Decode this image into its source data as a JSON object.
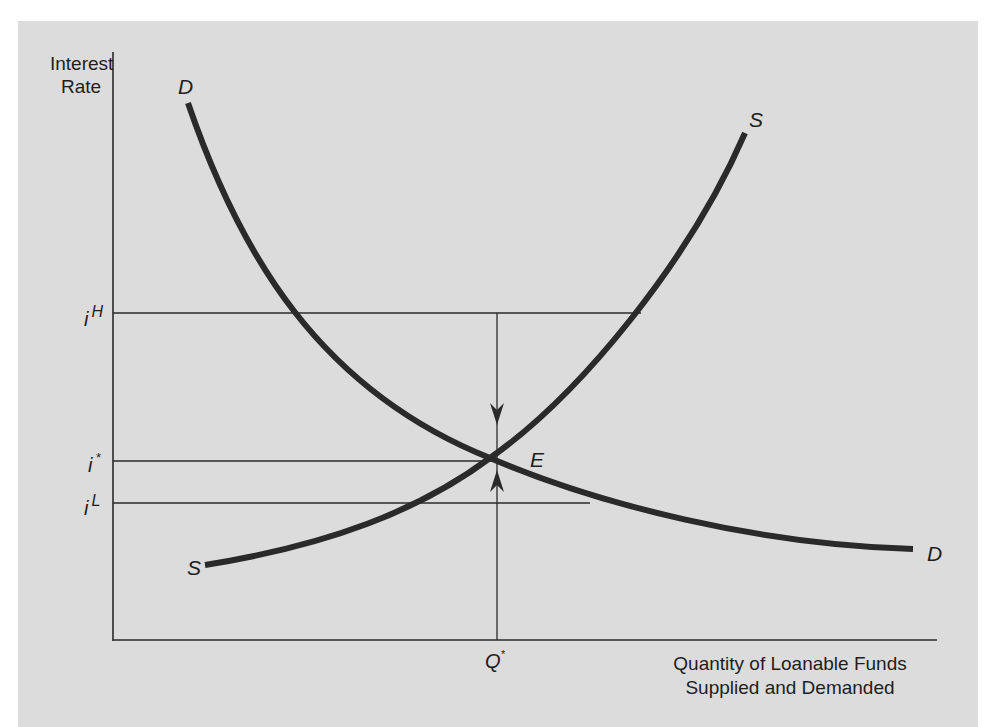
{
  "diagram": {
    "y_axis_label": [
      "Interest",
      "Rate"
    ],
    "x_axis_label": [
      "Quantity of Loanable Funds",
      "Supplied and Demanded"
    ],
    "rate_labels": {
      "high": {
        "base": "i",
        "sup": "H"
      },
      "equilibrium": {
        "base": "i",
        "sup": "*"
      },
      "low": {
        "base": "i",
        "sup": "L"
      }
    },
    "quantity_label": {
      "base": "Q",
      "sup": "*"
    },
    "curves": {
      "demand": {
        "start_label": "D",
        "end_label": "D"
      },
      "supply": {
        "start_label": "S",
        "end_label": "S"
      }
    },
    "equilibrium_label": "E",
    "colors": {
      "background": "#dcdcdc",
      "curve": "#2a2a2a",
      "line": "#2a2a2a",
      "text": "#1e1e1e"
    }
  }
}
